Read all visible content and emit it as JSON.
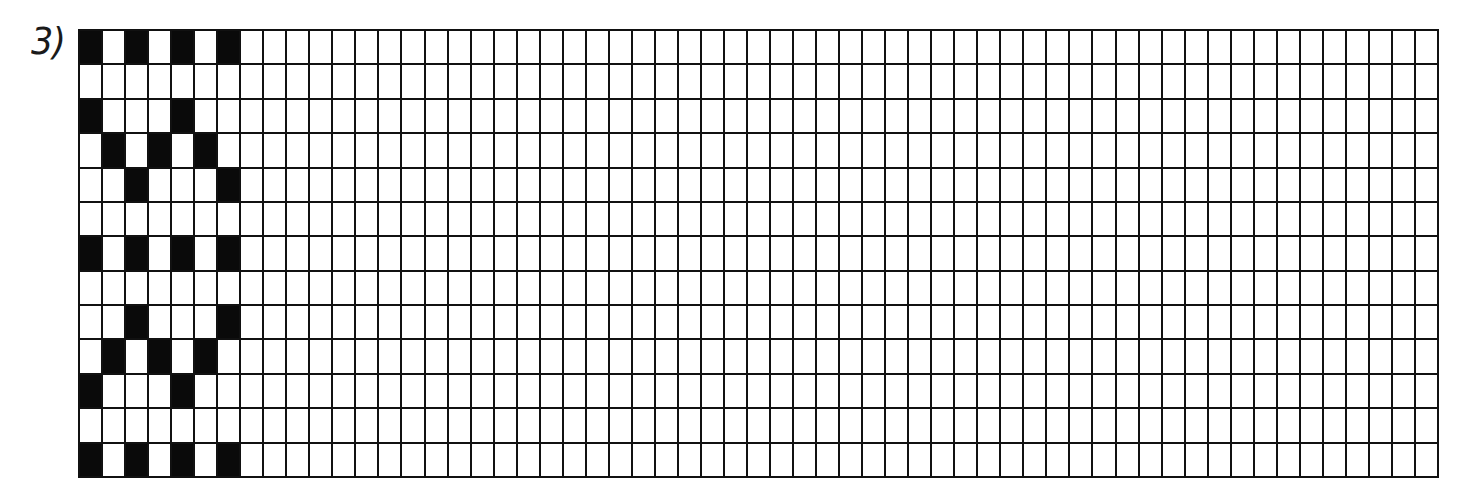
{
  "exercise": {
    "label": "3)",
    "grid": {
      "columns": 59,
      "rows": 13,
      "fill_color": "#0a0a0a",
      "empty_color": "#ffffff",
      "line_color": "#111111",
      "pattern_columns": 7,
      "pattern_rows": [
        [
          1,
          0,
          1,
          0,
          1,
          0,
          1
        ],
        [
          0,
          0,
          0,
          0,
          0,
          0,
          0
        ],
        [
          1,
          0,
          0,
          0,
          1,
          0,
          0
        ],
        [
          0,
          1,
          0,
          1,
          0,
          1,
          0
        ],
        [
          0,
          0,
          1,
          0,
          0,
          0,
          1
        ],
        [
          0,
          0,
          0,
          0,
          0,
          0,
          0
        ],
        [
          1,
          0,
          1,
          0,
          1,
          0,
          1
        ],
        [
          0,
          0,
          0,
          0,
          0,
          0,
          0
        ],
        [
          0,
          0,
          1,
          0,
          0,
          0,
          1
        ],
        [
          0,
          1,
          0,
          1,
          0,
          1,
          0
        ],
        [
          1,
          0,
          0,
          0,
          1,
          0,
          0
        ],
        [
          0,
          0,
          0,
          0,
          0,
          0,
          0
        ],
        [
          1,
          0,
          1,
          0,
          1,
          0,
          1
        ]
      ]
    }
  }
}
